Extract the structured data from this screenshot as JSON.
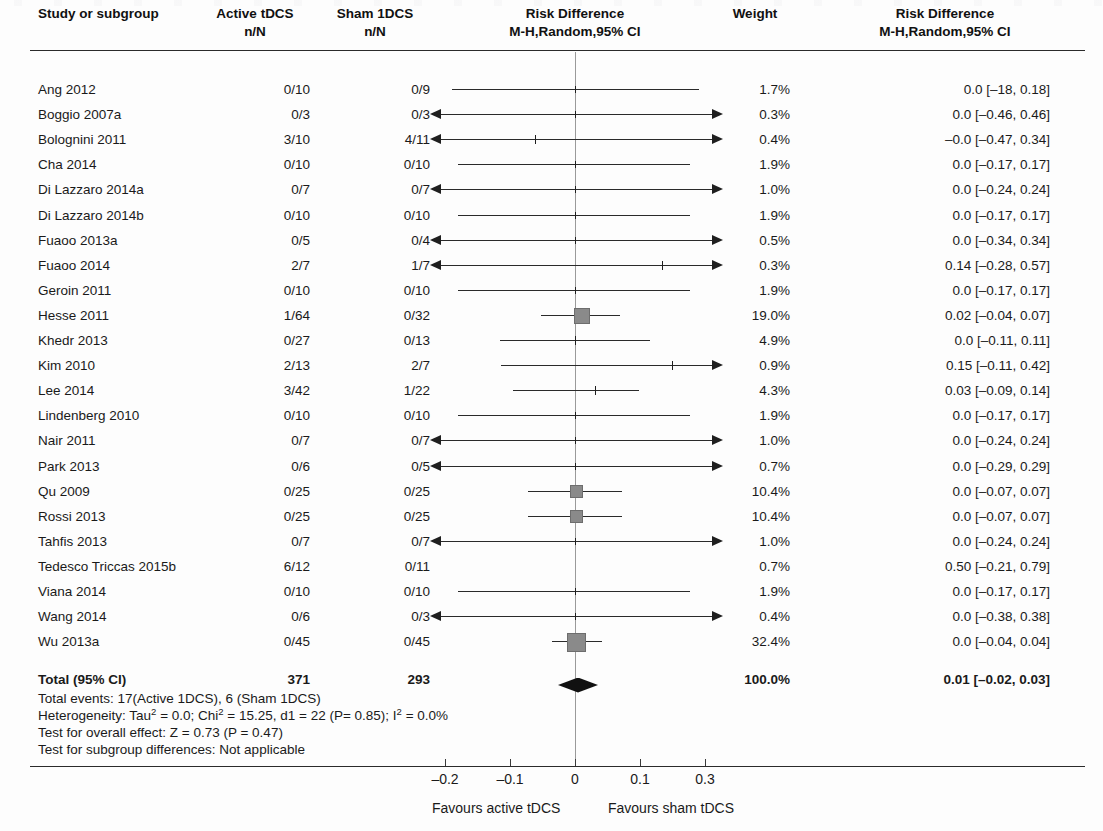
{
  "header": {
    "col_study": "Study or subgroup",
    "col_active_l1": "Active tDCS",
    "col_active_l2": "n/N",
    "col_sham_l1": "Sham 1DCS",
    "col_sham_l2": "n/N",
    "col_plot_l1": "Risk Difference",
    "col_plot_l2": "M-H,Random,95% CI",
    "col_weight": "Weight",
    "col_rd_l1": "Risk Difference",
    "col_rd_l2": "M-H,Random,95% CI"
  },
  "rows": [
    {
      "study": "Ang 2012",
      "active": "0/10",
      "sham": "0/9",
      "weight": "1.7%",
      "rd": "0.0 [–18, 0.18]"
    },
    {
      "study": "Boggio 2007a",
      "active": "0/3",
      "sham": "0/3",
      "weight": "0.3%",
      "rd": "0.0 [–0.46, 0.46]"
    },
    {
      "study": "Bolognini 2011",
      "active": "3/10",
      "sham": "4/11",
      "weight": "0.4%",
      "rd": "–0.0 [–0.47, 0.34]"
    },
    {
      "study": "Cha 2014",
      "active": "0/10",
      "sham": "0/10",
      "weight": "1.9%",
      "rd": "0.0 [–0.17, 0.17]"
    },
    {
      "study": "Di Lazzaro 2014a",
      "active": "0/7",
      "sham": "0/7",
      "weight": "1.0%",
      "rd": "0.0 [–0.24, 0.24]"
    },
    {
      "study": "Di Lazzaro 2014b",
      "active": "0/10",
      "sham": "0/10",
      "weight": "1.9%",
      "rd": "0.0 [–0.17, 0.17]"
    },
    {
      "study": "Fuaoo 2013a",
      "active": "0/5",
      "sham": "0/4",
      "weight": "0.5%",
      "rd": "0.0 [–0.34, 0.34]"
    },
    {
      "study": "Fuaoo 2014",
      "active": "2/7",
      "sham": "1/7",
      "weight": "0.3%",
      "rd": "0.14 [–0.28, 0.57]"
    },
    {
      "study": "Geroin 2011",
      "active": "0/10",
      "sham": "0/10",
      "weight": "1.9%",
      "rd": "0.0 [–0.17, 0.17]"
    },
    {
      "study": "Hesse 2011",
      "active": "1/64",
      "sham": "0/32",
      "weight": "19.0%",
      "rd": "0.02 [–0.04, 0.07]"
    },
    {
      "study": "Khedr 2013",
      "active": "0/27",
      "sham": "0/13",
      "weight": "4.9%",
      "rd": "0.0 [–0.11, 0.11]"
    },
    {
      "study": "Kim 2010",
      "active": "2/13",
      "sham": "2/7",
      "weight": "0.9%",
      "rd": "0.15 [–0.11, 0.42]"
    },
    {
      "study": "Lee 2014",
      "active": "3/42",
      "sham": "1/22",
      "weight": "4.3%",
      "rd": "0.03 [–0.09, 0.14]"
    },
    {
      "study": "Lindenberg 2010",
      "active": "0/10",
      "sham": "0/10",
      "weight": "1.9%",
      "rd": "0.0 [–0.17, 0.17]"
    },
    {
      "study": "Nair 2011",
      "active": "0/7",
      "sham": "0/7",
      "weight": "1.0%",
      "rd": "0.0 [–0.24, 0.24]"
    },
    {
      "study": "Park 2013",
      "active": "0/6",
      "sham": "0/5",
      "weight": "0.7%",
      "rd": "0.0 [–0.29, 0.29]"
    },
    {
      "study": "Qu 2009",
      "active": "0/25",
      "sham": "0/25",
      "weight": "10.4%",
      "rd": "0.0 [–0.07, 0.07]"
    },
    {
      "study": "Rossi 2013",
      "active": "0/25",
      "sham": "0/25",
      "weight": "10.4%",
      "rd": "0.0 [–0.07, 0.07]"
    },
    {
      "study": "Tahfis 2013",
      "active": "0/7",
      "sham": "0/7",
      "weight": "1.0%",
      "rd": "0.0 [–0.24, 0.24]"
    },
    {
      "study": "Tedesco Triccas 2015b",
      "active": "6/12",
      "sham": "0/11",
      "weight": "0.7%",
      "rd": "0.50 [–0.21, 0.79]"
    },
    {
      "study": "Viana 2014",
      "active": "0/10",
      "sham": "0/10",
      "weight": "1.9%",
      "rd": "0.0 [–0.17, 0.17]"
    },
    {
      "study": "Wang 2014",
      "active": "0/6",
      "sham": "0/3",
      "weight": "0.4%",
      "rd": "0.0 [–0.38, 0.38]"
    },
    {
      "study": "Wu 2013a",
      "active": "0/45",
      "sham": "0/45",
      "weight": "32.4%",
      "rd": "0.0 [–0.04, 0.04]"
    }
  ],
  "total": {
    "label": "Total (95% CI)",
    "active": "371",
    "sham": "293",
    "weight": "100.0%",
    "rd": "0.01 [–0.02, 0.03]"
  },
  "stats": {
    "total_events": "Total events: 17(Active 1DCS), 6 (Sham 1DCS)",
    "heterogeneity_pre": "Heterogeneity: Tau",
    "heterogeneity_a": " = 0.0; Chi",
    "heterogeneity_b": " = 15.25, d1 = 22 (P= 0.85); I",
    "heterogeneity_c": " = 0.0%",
    "sup2": "2",
    "overall_effect": "Test for overall effect: Z = 0.73 (P = 0.47)",
    "subgroup": "Test for subgroup differences: Not applicable"
  },
  "axis": {
    "ticks": [
      "–0.2",
      "–0.1",
      "0",
      "0.1",
      "0.3"
    ],
    "favours_left": "Favours active tDCS",
    "favours_right": "Favours sham tDCS"
  },
  "colors": {
    "rule": "#2b2b2b",
    "zero_line": "#9a9a9a",
    "ci": "#2a2a2a",
    "marker_fill": "#8a8a8a",
    "diamond": "#111111",
    "text": "#1a1a1a"
  },
  "chart_data": {
    "type": "forest",
    "title": "Risk Difference M-H,Random,95% CI",
    "xlabel": "Risk Difference",
    "xlim": [
      -0.25,
      0.35
    ],
    "xticks": [
      -0.2,
      -0.1,
      0,
      0.1,
      0.3
    ],
    "null_value": 0,
    "effect_measure": "Risk Difference (M-H, Random, 95% CI)",
    "categories": [
      "Ang 2012",
      "Boggio 2007a",
      "Bolognini 2011",
      "Cha 2014",
      "Di Lazzaro 2014a",
      "Di Lazzaro 2014b",
      "Fuaoo 2013a",
      "Fuaoo 2014",
      "Geroin 2011",
      "Hesse 2011",
      "Khedr 2013",
      "Kim 2010",
      "Lee 2014",
      "Lindenberg 2010",
      "Nair 2011",
      "Park 2013",
      "Qu 2009",
      "Rossi 2013",
      "Tahfis 2013",
      "Tedesco Triccas 2015b",
      "Viana 2014",
      "Wang 2014",
      "Wu 2013a"
    ],
    "estimates": [
      0.0,
      0.0,
      -0.0,
      0.0,
      0.0,
      0.0,
      0.0,
      0.14,
      0.0,
      0.02,
      0.0,
      0.15,
      0.03,
      0.0,
      0.0,
      0.0,
      0.0,
      0.0,
      0.0,
      0.5,
      0.0,
      0.0,
      0.0
    ],
    "ci_low": [
      -0.18,
      -0.46,
      -0.47,
      -0.17,
      -0.24,
      -0.17,
      -0.34,
      -0.28,
      -0.17,
      -0.04,
      -0.11,
      -0.11,
      -0.09,
      -0.17,
      -0.24,
      -0.29,
      -0.07,
      -0.07,
      -0.24,
      -0.21,
      -0.17,
      -0.38,
      -0.04
    ],
    "ci_high": [
      0.18,
      0.46,
      0.34,
      0.17,
      0.24,
      0.17,
      0.34,
      0.57,
      0.17,
      0.07,
      0.11,
      0.42,
      0.14,
      0.17,
      0.24,
      0.29,
      0.07,
      0.07,
      0.24,
      0.79,
      0.17,
      0.38,
      0.04
    ],
    "weights": [
      1.7,
      0.3,
      0.4,
      1.9,
      1.0,
      1.9,
      0.5,
      0.3,
      1.9,
      19.0,
      4.9,
      0.9,
      4.3,
      1.9,
      1.0,
      0.7,
      10.4,
      10.4,
      1.0,
      0.7,
      1.9,
      0.4,
      32.4
    ],
    "events_active": [
      0,
      0,
      3,
      0,
      0,
      0,
      0,
      2,
      0,
      1,
      0,
      2,
      3,
      0,
      0,
      0,
      0,
      0,
      0,
      6,
      0,
      0,
      0
    ],
    "total_active": [
      10,
      3,
      10,
      10,
      7,
      10,
      5,
      7,
      10,
      64,
      27,
      13,
      42,
      10,
      7,
      6,
      25,
      25,
      7,
      12,
      10,
      6,
      45
    ],
    "events_sham": [
      0,
      0,
      4,
      0,
      0,
      0,
      0,
      1,
      0,
      0,
      0,
      2,
      1,
      0,
      0,
      0,
      0,
      0,
      0,
      0,
      0,
      0,
      0
    ],
    "total_sham": [
      9,
      3,
      11,
      10,
      7,
      10,
      4,
      7,
      10,
      32,
      13,
      7,
      22,
      10,
      7,
      5,
      25,
      25,
      7,
      11,
      10,
      3,
      45
    ],
    "pooled": {
      "estimate": 0.01,
      "ci_low": -0.02,
      "ci_high": 0.03,
      "weight": 100.0,
      "total_active": 371,
      "total_sham": 293
    },
    "legend": [],
    "grid": false
  },
  "plot_geometry": {
    "rows": [
      {
        "x1": 452,
        "x2": 699,
        "arrowL": false,
        "arrowR": false,
        "mark": "none"
      },
      {
        "x1": 441,
        "x2": 712,
        "arrowL": true,
        "arrowR": true,
        "mark": "none"
      },
      {
        "x1": 441,
        "x2": 712,
        "arrowL": true,
        "arrowR": true,
        "mark": "tick",
        "mx": 535
      },
      {
        "x1": 458,
        "x2": 690,
        "arrowL": false,
        "arrowR": false,
        "mark": "none"
      },
      {
        "x1": 441,
        "x2": 712,
        "arrowL": true,
        "arrowR": true,
        "mark": "none"
      },
      {
        "x1": 458,
        "x2": 690,
        "arrowL": false,
        "arrowR": false,
        "mark": "none"
      },
      {
        "x1": 441,
        "x2": 712,
        "arrowL": true,
        "arrowR": true,
        "mark": "none"
      },
      {
        "x1": 441,
        "x2": 712,
        "arrowL": true,
        "arrowR": true,
        "mark": "tick",
        "mx": 662
      },
      {
        "x1": 458,
        "x2": 690,
        "arrowL": false,
        "arrowR": false,
        "mark": "none"
      },
      {
        "x1": 541,
        "x2": 620,
        "arrowL": false,
        "arrowR": false,
        "mark": "box",
        "mx": 581,
        "size": 14
      },
      {
        "x1": 500,
        "x2": 650,
        "arrowL": false,
        "arrowR": false,
        "mark": "tick",
        "mx": 575
      },
      {
        "x1": 501,
        "x2": 712,
        "arrowL": false,
        "arrowR": true,
        "mark": "tick",
        "mx": 672
      },
      {
        "x1": 513,
        "x2": 639,
        "arrowL": false,
        "arrowR": false,
        "mark": "tick",
        "mx": 595
      },
      {
        "x1": 458,
        "x2": 690,
        "arrowL": false,
        "arrowR": false,
        "mark": "none"
      },
      {
        "x1": 441,
        "x2": 712,
        "arrowL": true,
        "arrowR": true,
        "mark": "none"
      },
      {
        "x1": 441,
        "x2": 712,
        "arrowL": true,
        "arrowR": true,
        "mark": "none"
      },
      {
        "x1": 528,
        "x2": 622,
        "arrowL": false,
        "arrowR": false,
        "mark": "box",
        "mx": 575,
        "size": 11
      },
      {
        "x1": 528,
        "x2": 622,
        "arrowL": false,
        "arrowR": false,
        "mark": "box",
        "mx": 575,
        "size": 11
      },
      {
        "x1": 441,
        "x2": 712,
        "arrowL": true,
        "arrowR": true,
        "mark": "none"
      },
      {
        "x1": 0,
        "x2": 0,
        "arrowL": false,
        "arrowR": false,
        "mark": "none"
      },
      {
        "x1": 458,
        "x2": 690,
        "arrowL": false,
        "arrowR": false,
        "mark": "none"
      },
      {
        "x1": 441,
        "x2": 712,
        "arrowL": true,
        "arrowR": true,
        "mark": "none"
      },
      {
        "x1": 552,
        "x2": 602,
        "arrowL": false,
        "arrowR": false,
        "mark": "box",
        "mx": 575,
        "size": 17
      }
    ],
    "row_y_start": 82,
    "row_step": 25.1,
    "zero_x": 575,
    "diamond": {
      "cx": 578,
      "cy": 685,
      "w": 40,
      "h": 15
    },
    "axis_tick_x": [
      445,
      510,
      575,
      640,
      705
    ]
  }
}
